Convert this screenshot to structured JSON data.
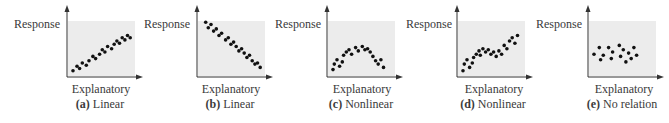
{
  "figure": {
    "panels": [
      {
        "id": "a",
        "letter": "(a)",
        "caption": "Linear",
        "ylabel": "Response",
        "xlabel": "Explanatory"
      },
      {
        "id": "b",
        "letter": "(b)",
        "caption": "Linear",
        "ylabel": "Response",
        "xlabel": "Explanatory"
      },
      {
        "id": "c",
        "letter": "(c)",
        "caption": "Nonlinear",
        "ylabel": "Response",
        "xlabel": "Explanatory"
      },
      {
        "id": "d",
        "letter": "(d)",
        "caption": "Nonlinear",
        "ylabel": "Response",
        "xlabel": "Explanatory"
      },
      {
        "id": "e",
        "letter": "(e)",
        "caption": "No relation",
        "ylabel": "Response",
        "xlabel": "Explanatory"
      }
    ],
    "colors": {
      "background": "#ffffff",
      "plot_fill": "#ececec",
      "axis": "#333333",
      "dot": "#111111",
      "text": "#3a3a3a"
    }
  },
  "chart_data": [
    {
      "type": "scatter",
      "title": "(a) Linear",
      "xlabel": "Explanatory",
      "ylabel": "Response",
      "grid": false,
      "points": [
        [
          3,
          3
        ],
        [
          6,
          7
        ],
        [
          8,
          5
        ],
        [
          10,
          10
        ],
        [
          13,
          8
        ],
        [
          15,
          12
        ],
        [
          18,
          16
        ],
        [
          20,
          14
        ],
        [
          23,
          18
        ],
        [
          25,
          22
        ],
        [
          27,
          20
        ],
        [
          29,
          25
        ],
        [
          32,
          23
        ],
        [
          34,
          27
        ],
        [
          36,
          30
        ],
        [
          38,
          28
        ],
        [
          40,
          33
        ],
        [
          42,
          31
        ],
        [
          44,
          35
        ],
        [
          46,
          33
        ]
      ]
    },
    {
      "type": "scatter",
      "title": "(b) Linear",
      "xlabel": "Explanatory",
      "ylabel": "Response",
      "grid": false,
      "points": [
        [
          5,
          47
        ],
        [
          7,
          42
        ],
        [
          9,
          45
        ],
        [
          11,
          39
        ],
        [
          13,
          41
        ],
        [
          15,
          35
        ],
        [
          17,
          37
        ],
        [
          20,
          31
        ],
        [
          22,
          33
        ],
        [
          24,
          27
        ],
        [
          26,
          29
        ],
        [
          28,
          25
        ],
        [
          30,
          21
        ],
        [
          32,
          23
        ],
        [
          34,
          19
        ],
        [
          36,
          15
        ],
        [
          38,
          17
        ],
        [
          40,
          12
        ],
        [
          42,
          9
        ],
        [
          44,
          10
        ],
        [
          46,
          6
        ]
      ]
    },
    {
      "type": "scatter",
      "title": "(c) Nonlinear",
      "xlabel": "Explanatory",
      "ylabel": "Response",
      "grid": false,
      "points": [
        [
          3,
          4
        ],
        [
          4,
          9
        ],
        [
          6,
          13
        ],
        [
          8,
          7
        ],
        [
          10,
          11
        ],
        [
          11,
          17
        ],
        [
          13,
          20
        ],
        [
          15,
          22
        ],
        [
          17,
          18
        ],
        [
          20,
          24
        ],
        [
          22,
          21
        ],
        [
          25,
          25
        ],
        [
          27,
          22
        ],
        [
          29,
          23
        ],
        [
          31,
          20
        ],
        [
          33,
          16
        ],
        [
          35,
          12
        ],
        [
          37,
          9
        ],
        [
          39,
          13
        ],
        [
          41,
          6
        ]
      ]
    },
    {
      "type": "scatter",
      "title": "(d) Nonlinear",
      "xlabel": "Explanatory",
      "ylabel": "Response",
      "grid": false,
      "points": [
        [
          3,
          3
        ],
        [
          4,
          9
        ],
        [
          6,
          13
        ],
        [
          8,
          6
        ],
        [
          10,
          10
        ],
        [
          11,
          15
        ],
        [
          13,
          18
        ],
        [
          15,
          21
        ],
        [
          16,
          17
        ],
        [
          18,
          23
        ],
        [
          20,
          20
        ],
        [
          22,
          22
        ],
        [
          24,
          18
        ],
        [
          26,
          20
        ],
        [
          28,
          16
        ],
        [
          30,
          21
        ],
        [
          32,
          18
        ],
        [
          34,
          26
        ],
        [
          36,
          23
        ],
        [
          38,
          30
        ],
        [
          40,
          33
        ],
        [
          42,
          28
        ],
        [
          44,
          35
        ]
      ]
    },
    {
      "type": "scatter",
      "title": "(e) No relation",
      "xlabel": "Explanatory",
      "ylabel": "Response",
      "grid": false,
      "points": [
        [
          3,
          18
        ],
        [
          7,
          24
        ],
        [
          8,
          13
        ],
        [
          10,
          17
        ],
        [
          14,
          24
        ],
        [
          16,
          14
        ],
        [
          17,
          20
        ],
        [
          22,
          26
        ],
        [
          23,
          16
        ],
        [
          25,
          22
        ],
        [
          27,
          11
        ],
        [
          29,
          19
        ],
        [
          31,
          14
        ],
        [
          33,
          24
        ],
        [
          35,
          17
        ]
      ]
    }
  ]
}
